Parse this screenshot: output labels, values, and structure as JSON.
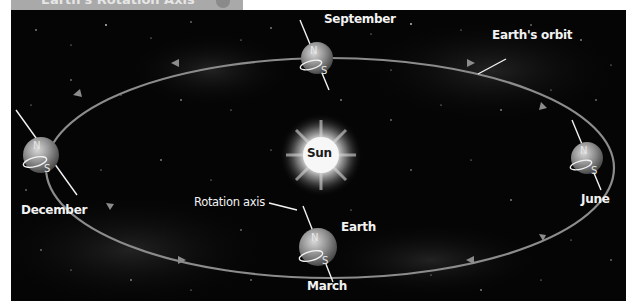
{
  "header": {
    "title": "Earth's Rotation Axis"
  },
  "diagram": {
    "type": "orbit-diagram",
    "colors": {
      "background": "#050505",
      "orbit": "#8c8c8c",
      "label": "#f2f2f2",
      "earth": "#9a9a9a",
      "sun": "#ffffff"
    },
    "sun": {
      "label": "Sun"
    },
    "orbit_label": "Earth's orbit",
    "earth_label": "Earth",
    "axis_label": "Rotation axis",
    "positions": [
      {
        "month": "September",
        "north": "N",
        "south": "S"
      },
      {
        "month": "June",
        "north": "N",
        "south": "S"
      },
      {
        "month": "March",
        "north": "N",
        "south": "S"
      },
      {
        "month": "December",
        "north": "N",
        "south": "S"
      }
    ],
    "orbit_direction": "counter-clockwise"
  }
}
